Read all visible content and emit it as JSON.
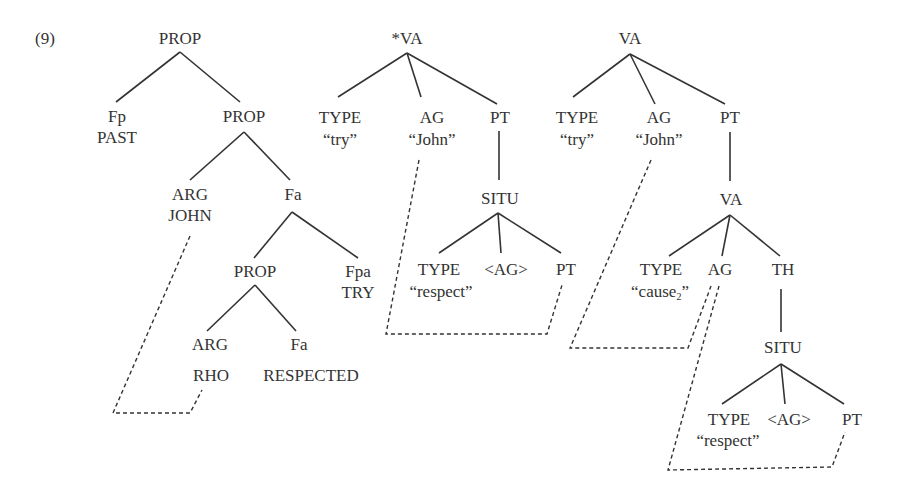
{
  "example_number": "(9)",
  "tree1": {
    "root": "PROP",
    "fp": {
      "label": "Fp",
      "value": "PAST"
    },
    "prop2": "PROP",
    "arg_john": {
      "label": "ARG",
      "value": "JOHN"
    },
    "fa": "Fa",
    "prop3": "PROP",
    "fpa": {
      "label": "Fpa",
      "value": "TRY"
    },
    "arg_rho": {
      "label": "ARG",
      "value": "RHO"
    },
    "fa2": {
      "label": "Fa",
      "value": "RESPECTED"
    }
  },
  "tree2": {
    "root": "*VA",
    "type": {
      "label": "TYPE",
      "value": "“try”"
    },
    "ag": {
      "label": "AG",
      "value": "“John”"
    },
    "pt": "PT",
    "situ": "SITU",
    "situ_type": {
      "label": "TYPE",
      "value": "“respect”"
    },
    "situ_ag": "<AG>",
    "situ_pt": "PT"
  },
  "tree3": {
    "root": "VA",
    "type": {
      "label": "TYPE",
      "value": "“try”"
    },
    "ag": {
      "label": "AG",
      "value": "“John”"
    },
    "pt": "PT",
    "va2": "VA",
    "va2_type": {
      "label": "TYPE",
      "value": "“cause",
      "subscript": "2",
      "close": "”"
    },
    "va2_ag": "AG",
    "va2_th": "TH",
    "situ": "SITU",
    "situ_type": {
      "label": "TYPE",
      "value": "“respect”"
    },
    "situ_ag": "<AG>",
    "situ_pt": "PT"
  }
}
